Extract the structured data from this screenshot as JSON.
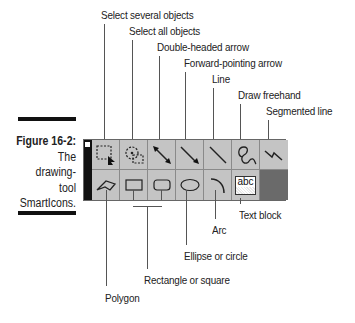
{
  "figure": {
    "number_label": "Figure 16-2:",
    "caption_lines": [
      "The",
      "drawing-",
      "tool",
      "SmartIcons."
    ]
  },
  "top_callouts": [
    {
      "label": "Select several objects"
    },
    {
      "label": "Select all objects"
    },
    {
      "label": "Double-headed arrow"
    },
    {
      "label": "Forward-pointing arrow"
    },
    {
      "label": "Line"
    },
    {
      "label": "Draw freehand"
    },
    {
      "label": "Segmented line"
    }
  ],
  "bottom_callouts": [
    {
      "label": "Text block"
    },
    {
      "label": "Arc"
    },
    {
      "label": "Ellipse or circle"
    },
    {
      "label": "Rectangle or square"
    },
    {
      "label": "Polygon"
    }
  ],
  "toolbar": {
    "row1": [
      {
        "icon": "select-several-icon"
      },
      {
        "icon": "select-all-icon"
      },
      {
        "icon": "double-headed-arrow-icon"
      },
      {
        "icon": "forward-arrow-icon"
      },
      {
        "icon": "line-icon"
      },
      {
        "icon": "freehand-icon"
      },
      {
        "icon": "segmented-line-icon"
      }
    ],
    "row2": [
      {
        "icon": "polygon-icon"
      },
      {
        "icon": "rectangle-icon"
      },
      {
        "icon": "rounded-rectangle-icon"
      },
      {
        "icon": "ellipse-icon"
      },
      {
        "icon": "arc-icon"
      },
      {
        "icon": "text-block-icon",
        "text": "abc"
      },
      {
        "icon": "color-swatch-icon"
      }
    ],
    "colors": {
      "button_face": "#c4c4c4",
      "swatch": "#6a6a6a",
      "strip": "#111111"
    }
  }
}
